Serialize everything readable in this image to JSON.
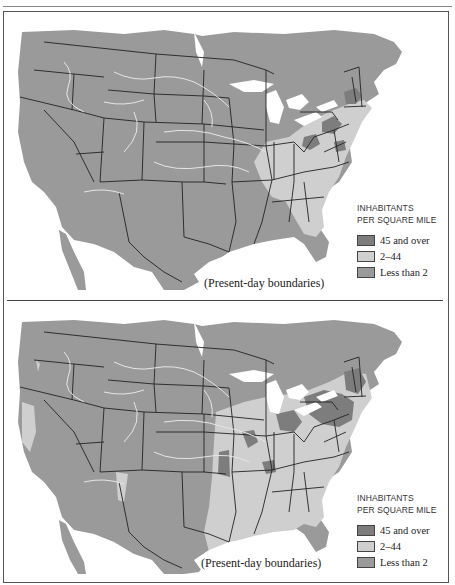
{
  "colors": {
    "high_density": "#7d7d7d",
    "medium_density": "#cfcfcf",
    "low_density": "#9a9a9a",
    "water": "#ffffff",
    "boundary": "#222222",
    "river": "#e6e6e6"
  },
  "maps": [
    {
      "id": "top",
      "caption": "(Present-day boundaries)",
      "legend": {
        "title_line1": "INHABITANTS",
        "title_line2": "PER SQUARE MILE",
        "items": [
          {
            "label": "45 and over",
            "color": "#7d7d7d"
          },
          {
            "label": "2–44",
            "color": "#cfcfcf"
          },
          {
            "label": "Less than 2",
            "color": "#9a9a9a"
          }
        ]
      }
    },
    {
      "id": "bottom",
      "caption": "(Present-day boundaries)",
      "legend": {
        "title_line1": "INHABITANTS",
        "title_line2": "PER SQUARE MILE",
        "items": [
          {
            "label": "45 and over",
            "color": "#7d7d7d"
          },
          {
            "label": "2–44",
            "color": "#cfcfcf"
          },
          {
            "label": "Less than 2",
            "color": "#9a9a9a"
          }
        ]
      }
    }
  ]
}
